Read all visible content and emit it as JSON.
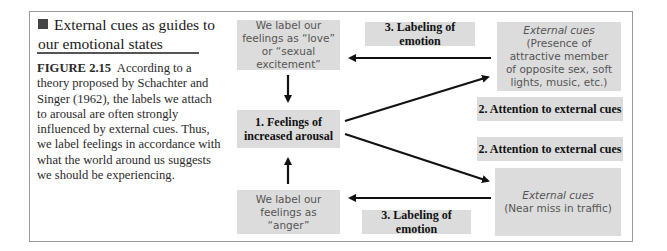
{
  "caption": {
    "title": "External cues as guides to our emotional states",
    "figure_label": "FIGURE 2.15",
    "body": "According to a theory proposed by Schachter and Singer (1962), the labels we attach to arousal are often strongly influenced by external cues. Thus, we label feelings in accordance with what the world around us suggests we should be experiencing."
  },
  "diagram": {
    "label_love": "We label our feelings as “love” or “sexual excitement”",
    "arousal": "1. Feelings of increased arousal",
    "label_anger": "We label our feelings as “anger”",
    "labeling_top": "3. Labeling of emotion",
    "labeling_bottom": "3. Labeling of emotion",
    "attention_top": "2. Attention to external cues",
    "attention_bottom": "2. Attention to external cues",
    "ext_top_italic": "External cues",
    "ext_top_rest": " (Presence of attractive member of opposite sex, soft lights, music, etc.)",
    "ext_bottom_italic": "External cues",
    "ext_bottom_rest": "(Near miss in traffic)"
  },
  "colors": {
    "box_fill": "#dcdcdc",
    "arrow": "#111111",
    "frame": "#9a9a9a"
  }
}
